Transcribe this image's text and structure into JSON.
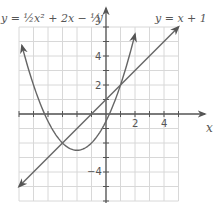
{
  "chart_data": {
    "type": "line",
    "title": "",
    "xlabel": "x",
    "ylabel": "y",
    "xlim": [
      -6,
      5
    ],
    "ylim": [
      -6,
      6
    ],
    "grid": true,
    "x_tick_labels": [
      "2",
      "4"
    ],
    "y_tick_labels": [
      "4",
      "2",
      "-4"
    ],
    "series": [
      {
        "name": "y = 1/2 x^2 + 2x - 1/2",
        "label_display": "y = ½x² + 2x − ½",
        "type": "parabola",
        "equation": {
          "a": 0.5,
          "b": 2,
          "c": -0.5
        },
        "vertex": [
          -2,
          -2.5
        ],
        "x_range": [
          -5.8,
          2
        ],
        "color": "#666666"
      },
      {
        "name": "y = x + 1",
        "label_display": "y = x + 1",
        "type": "line",
        "equation": {
          "m": 1,
          "b": 1
        },
        "x_range": [
          -6,
          5
        ],
        "color": "#666666"
      }
    ],
    "intersections": [
      [
        -3,
        -2
      ],
      [
        1,
        2
      ]
    ]
  },
  "labels": {
    "parabola": "y = ½x² + 2x − ½",
    "line": "y = x + 1",
    "x_axis": "x",
    "y_axis": "y",
    "tick_x2": "2",
    "tick_x4": "4",
    "tick_y4": "4",
    "tick_y2": "2",
    "tick_yneg4": "−4"
  },
  "colors": {
    "grid": "#d8d8d8",
    "axis": "#555555",
    "curve": "#666666"
  }
}
